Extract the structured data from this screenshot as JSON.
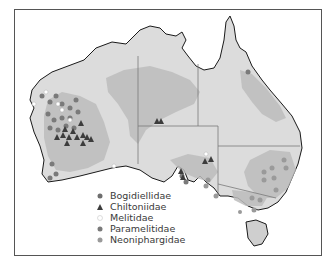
{
  "map": {
    "title": "",
    "region": "Australia",
    "colors": {
      "land": "#dcdcdc",
      "shaded_region": "#bdbdbd",
      "coast": "#1a1a1a",
      "border": "#7a7a7a",
      "bogidiellidae": "#6e6e6e",
      "chitoniidae": "#3c3c3c",
      "melitidae": "#ffffff",
      "paramelitidae": "#7a7a7a",
      "neoniphargidae": "#9a9a9a"
    }
  },
  "legend": {
    "items": [
      {
        "label": "Bogidiellidae",
        "marker": "circle-dark"
      },
      {
        "label": "Chiltoniidae",
        "marker": "triangle"
      },
      {
        "label": "Melitidae",
        "marker": "circle-white"
      },
      {
        "label": "Paramelitidae",
        "marker": "circle-mid"
      },
      {
        "label": "Neoniphargidae",
        "marker": "circle-light"
      }
    ]
  }
}
